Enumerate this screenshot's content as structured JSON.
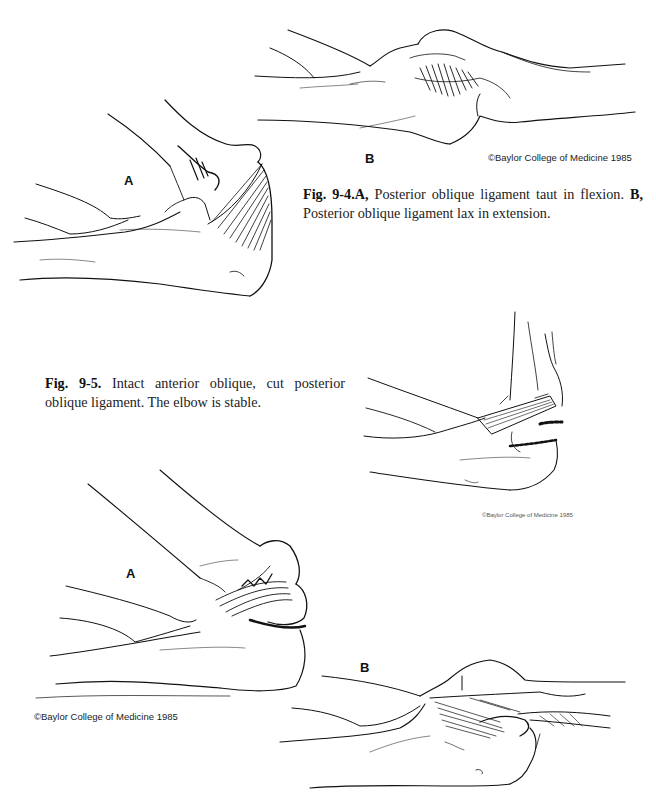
{
  "figure_9_4": {
    "panel_a_label": "A",
    "panel_b_label": "B",
    "copyright": "©Baylor College of Medicine 1985",
    "caption": {
      "fig_number": "Fig. 9-4.",
      "part_a_label": "A,",
      "part_a_text": " Posterior oblique ligament taut in flexion. ",
      "part_b_label": "B,",
      "part_b_text": " Posterior oblique ligament lax in extension."
    },
    "illustrations": {
      "panel_a": "Elbow in flexion, posterior oblique ligament taut (fan-shaped fibers)",
      "panel_b": "Elbow in extension, posterior oblique ligament lax"
    }
  },
  "figure_9_5": {
    "copyright": "©Baylor College of Medicine 1985",
    "caption": {
      "fig_number": "Fig. 9-5.",
      "text": " Intact anterior oblique, cut posterior oblique ligament. The elbow is stable."
    },
    "illustration": "Elbow with intact anterior oblique ligament and sutured/cut posterior oblique ligament"
  },
  "figure_9_6": {
    "panel_a_label": "A",
    "panel_b_label": "B",
    "copyright": "©Baylor College of Medicine 1985",
    "illustrations": {
      "panel_a": "Elbow in flexion with ligament detail",
      "panel_b": "Elbow in extension with ligament detail"
    }
  }
}
